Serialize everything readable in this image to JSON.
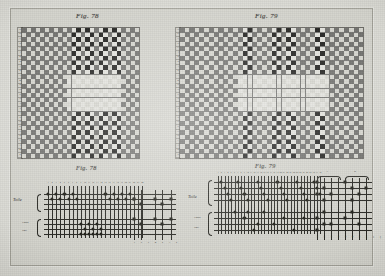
{
  "plate": {
    "title_left": "Fig. 78",
    "title_right": "Fig. 79",
    "title_left_lower": "Fig. 78",
    "title_right_lower": "Fig. 79",
    "colors": {
      "paper": "#d2d2cb",
      "mount": "#d8d8d2",
      "ground_dark": "#6e6e6b",
      "ground_light": "#d4d4cd",
      "motif_black": "#1b1b19",
      "motif_white": "#e2e2dc",
      "ink": "#24241f"
    }
  },
  "figure78": {
    "label": "Fig. 78",
    "grid": {
      "columns": 26,
      "rows": 28,
      "description": "point-paper weave draft: checkerboard ground with black/white motif stripes"
    },
    "row_labels": [
      "a",
      "b",
      "c",
      "d",
      "e",
      "f",
      "g",
      "h",
      "i",
      "k",
      "l",
      "m",
      "n",
      "o",
      "p",
      "q",
      "r",
      "s",
      "t",
      "u"
    ]
  },
  "figure79": {
    "label": "Fig. 79",
    "grid": {
      "columns": 38,
      "rows": 28,
      "description": "point-paper weave draft: checkerboard ground with black/white motif stripes"
    },
    "row_labels": [
      "a",
      "b",
      "c",
      "d",
      "e",
      "f",
      "g",
      "h",
      "i",
      "k",
      "l",
      "m",
      "n",
      "o",
      "p",
      "q",
      "r",
      "s",
      "t",
      "u"
    ]
  },
  "schematic78": {
    "label": "Fig. 78",
    "left_labels": [
      "Toile",
      "Liage",
      "Poil"
    ],
    "top_numbers": [
      "1",
      "2",
      "3",
      "4",
      "5",
      "6",
      "7",
      "8",
      "9",
      "10",
      "11",
      "12",
      "13",
      "14",
      "15",
      "16",
      "17",
      "18",
      "19",
      "20",
      "21",
      "22",
      "23",
      "24"
    ],
    "bottom_numbers": [
      "1",
      "2",
      "3",
      "4",
      "5",
      "6",
      "7",
      "8"
    ],
    "cord_rows": 8,
    "cord_columns": 24
  },
  "schematic79": {
    "label": "Fig. 79",
    "left_labels": [
      "Toile",
      "Liage",
      "Poil"
    ],
    "top_numbers": [
      "1",
      "2",
      "3",
      "4",
      "5",
      "6",
      "7",
      "8",
      "9",
      "10",
      "11",
      "12",
      "13",
      "14",
      "15",
      "16",
      "17",
      "18",
      "19",
      "20",
      "21",
      "22",
      "23",
      "24",
      "25",
      "26",
      "27",
      "28",
      "29",
      "30",
      "31",
      "32"
    ],
    "bottom_numbers": [
      "1",
      "2",
      "3",
      "4",
      "5",
      "6",
      "7",
      "8",
      "9",
      "10",
      "11",
      "12"
    ],
    "bracket_labels": [
      "A",
      "B"
    ],
    "cord_rows": 9,
    "cord_columns": 32
  }
}
